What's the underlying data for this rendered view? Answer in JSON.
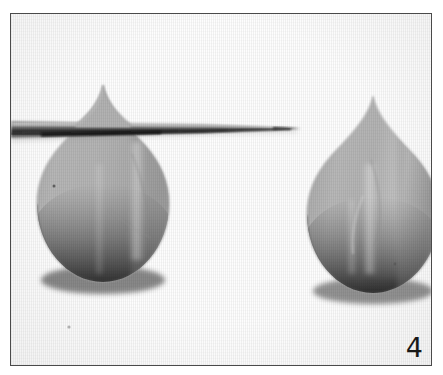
{
  "figure": {
    "number_label": "4",
    "caption_position": "bottom-right",
    "border_color": "#4a4a4a",
    "background_color": "#ffffff"
  },
  "photo": {
    "medium": "grayscale photograph",
    "plate_background": "#fdfdfd",
    "objects": [
      {
        "name": "teardrop-left",
        "shape": "teardrop",
        "fill_color": "#b2b2b2",
        "shadow_color": "#2e2e2e",
        "highlight_color": "#cacaca",
        "apex_x": 102,
        "apex_y": 84,
        "bottom_y": 290,
        "left_x": 29,
        "right_x": 163,
        "pierced_by_needle": true
      },
      {
        "name": "teardrop-right",
        "shape": "teardrop",
        "fill_color": "#b2b2b2",
        "shadow_color": "#2e2e2e",
        "highlight_color": "#cacaca",
        "apex_x": 372,
        "apex_y": 95,
        "bottom_y": 295,
        "left_x": 300,
        "right_x": 425,
        "pierced_by_needle": false
      },
      {
        "name": "needle",
        "shape": "tapered-pin",
        "fill_color": "#5a5a5a",
        "highlight_color": "#9a9a9a",
        "start_x": 11,
        "tip_x": 296,
        "axis_y": 126,
        "max_thickness": 9
      }
    ]
  }
}
